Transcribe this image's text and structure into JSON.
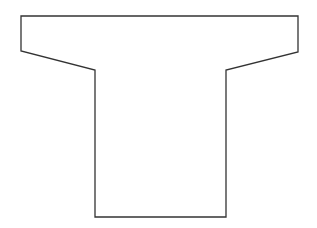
{
  "diagram": {
    "shape": "t-shaped-outline",
    "stroke_color": "#333333",
    "fill_color": "#ffffff",
    "background": "#ffffff",
    "points": [
      [
        21,
        16
      ],
      [
        298,
        16
      ],
      [
        298,
        52
      ],
      [
        226,
        70
      ],
      [
        226,
        217
      ],
      [
        95,
        217
      ],
      [
        95,
        70
      ],
      [
        21,
        51
      ]
    ]
  }
}
